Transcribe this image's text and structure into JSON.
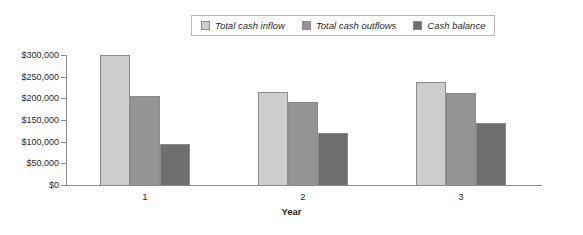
{
  "chart_data": {
    "type": "bar",
    "title": "",
    "xlabel": "Year",
    "ylabel": "",
    "categories": [
      "1",
      "2",
      "3"
    ],
    "series": [
      {
        "name": "Total cash inflow",
        "color": "#cdcdcd",
        "values": [
          300000,
          215000,
          237000
        ]
      },
      {
        "name": "Total cash outflows",
        "color": "#949494",
        "values": [
          205000,
          192000,
          212000
        ]
      },
      {
        "name": "Cash balance",
        "color": "#6e6e6e",
        "values": [
          95000,
          120000,
          142000
        ]
      }
    ],
    "ylim": [
      0,
      300000
    ],
    "ytick_labels": [
      "$300,000",
      "$250,000",
      "$200,000",
      "$150,000",
      "$100,000",
      "$50,000",
      "$0"
    ],
    "ytick_values": [
      300000,
      250000,
      200000,
      150000,
      100000,
      50000,
      0
    ],
    "grid": false,
    "legend_position": "top-center"
  },
  "legend": {
    "entries": [
      {
        "label": "Total cash inflow"
      },
      {
        "label": "Total cash outflows"
      },
      {
        "label": "Cash balance"
      }
    ]
  },
  "axis": {
    "x_title": "Year"
  }
}
